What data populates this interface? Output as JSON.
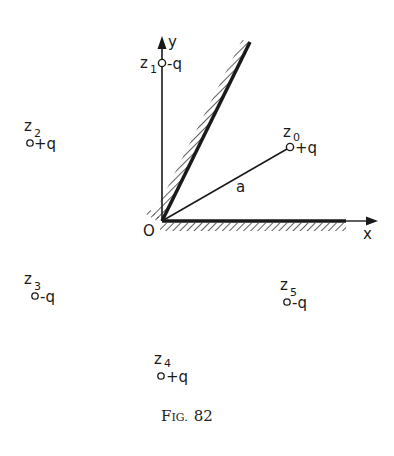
{
  "figure": {
    "caption_prefix": "F",
    "caption_smallcaps": "IG.",
    "caption_number": "82"
  },
  "axes": {
    "x_label": "x",
    "y_label": "y",
    "origin_label": "O"
  },
  "segment": {
    "label": "a"
  },
  "charges": [
    {
      "id": "z0",
      "name": "z",
      "sub": "0",
      "charge": "+q"
    },
    {
      "id": "z1",
      "name": "z",
      "sub": "1",
      "charge": "-q"
    },
    {
      "id": "z2",
      "name": "z",
      "sub": "2",
      "charge": "+q"
    },
    {
      "id": "z3",
      "name": "z",
      "sub": "3",
      "charge": "-q"
    },
    {
      "id": "z4",
      "name": "z",
      "sub": "4",
      "charge": "+q"
    },
    {
      "id": "z5",
      "name": "z",
      "sub": "5",
      "charge": "-q"
    }
  ],
  "colors": {
    "ink": "#1a1a1a",
    "background": "#ffffff"
  }
}
